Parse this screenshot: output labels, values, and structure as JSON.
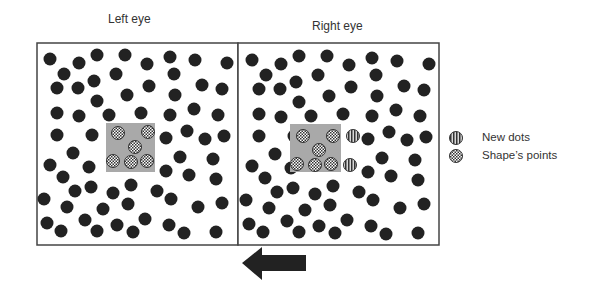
{
  "titles": {
    "left": "Left eye",
    "right": "Right eye"
  },
  "legend": {
    "new_dots": "New dots",
    "shape_points": "Shape’s points"
  },
  "colors": {
    "dot": "#222222",
    "shape_box": "#a9a9a9",
    "border": "#444444",
    "arrow": "#222222"
  },
  "arrow": {
    "direction": "left"
  },
  "panels": {
    "left": {
      "x": 37,
      "y": 43,
      "w": 201,
      "h": 202
    },
    "right": {
      "x": 238,
      "y": 43,
      "w": 201,
      "h": 202
    },
    "right_dot_offset_x": 202,
    "dot_radius": 6.5
  },
  "left_dots": [
    [
      50,
      59
    ],
    [
      79,
      63
    ],
    [
      97,
      55
    ],
    [
      125,
      55
    ],
    [
      64,
      74
    ],
    [
      116,
      74
    ],
    [
      57,
      88
    ],
    [
      78,
      88
    ],
    [
      94,
      81
    ],
    [
      127,
      95
    ],
    [
      97,
      101
    ],
    [
      57,
      113
    ],
    [
      79,
      116
    ],
    [
      109,
      115
    ],
    [
      57,
      135
    ],
    [
      92,
      135
    ],
    [
      147,
      64
    ],
    [
      170,
      57
    ],
    [
      195,
      60
    ],
    [
      227,
      63
    ],
    [
      174,
      74
    ],
    [
      149,
      86
    ],
    [
      202,
      85
    ],
    [
      222,
      89
    ],
    [
      175,
      95
    ],
    [
      194,
      109
    ],
    [
      170,
      115
    ],
    [
      218,
      115
    ],
    [
      141,
      113
    ],
    [
      187,
      131
    ],
    [
      166,
      138
    ],
    [
      205,
      139
    ],
    [
      224,
      136
    ],
    [
      73,
      153
    ],
    [
      50,
      165
    ],
    [
      89,
      167
    ],
    [
      63,
      177
    ],
    [
      75,
      191
    ],
    [
      91,
      187
    ],
    [
      44,
      199
    ],
    [
      67,
      207
    ],
    [
      103,
      209
    ],
    [
      113,
      193
    ],
    [
      131,
      185
    ],
    [
      128,
      204
    ],
    [
      47,
      223
    ],
    [
      61,
      231
    ],
    [
      85,
      220
    ],
    [
      97,
      231
    ],
    [
      117,
      225
    ],
    [
      133,
      232
    ],
    [
      180,
      157
    ],
    [
      213,
      159
    ],
    [
      166,
      171
    ],
    [
      189,
      175
    ],
    [
      216,
      179
    ],
    [
      157,
      191
    ],
    [
      171,
      199
    ],
    [
      198,
      207
    ],
    [
      222,
      203
    ],
    [
      145,
      219
    ],
    [
      169,
      225
    ],
    [
      184,
      233
    ],
    [
      216,
      232
    ]
  ],
  "shape": {
    "left_box": {
      "x": 106,
      "y": 123,
      "w": 49,
      "h": 49
    },
    "right_box": {
      "x": 290,
      "y": 124,
      "w": 51,
      "h": 48
    },
    "left_points": [
      [
        118,
        133
      ],
      [
        148,
        132
      ],
      [
        135,
        147
      ],
      [
        113,
        161
      ],
      [
        131,
        162
      ],
      [
        147,
        161
      ]
    ],
    "right_points": [
      [
        303,
        136
      ],
      [
        333,
        136
      ],
      [
        319,
        150
      ],
      [
        297,
        164
      ],
      [
        315,
        165
      ],
      [
        331,
        164
      ]
    ],
    "new_dots": [
      [
        353,
        136
      ],
      [
        350,
        165
      ]
    ]
  }
}
